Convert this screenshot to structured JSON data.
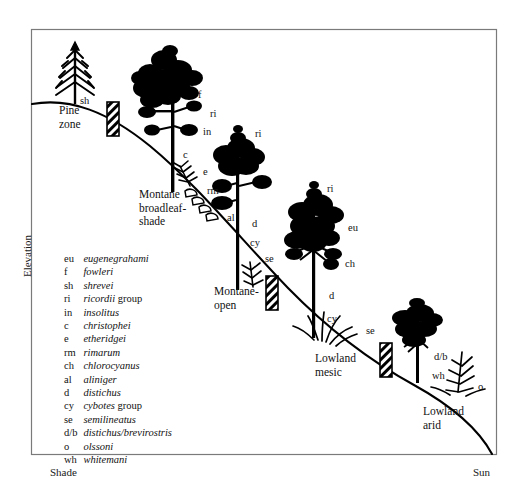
{
  "figure": {
    "axes": {
      "y_label": "Elevation",
      "x_left_label": "Shade",
      "x_right_label": "Sun"
    },
    "zones": [
      {
        "id": "pine",
        "label": "Pine\nzone"
      },
      {
        "id": "montane-broadleaf-shade",
        "label": "Montane\nbroadleaf-\nshade"
      },
      {
        "id": "montane-open",
        "label": "Montane-\nopen"
      },
      {
        "id": "lowland-mesic",
        "label": "Lowland\nmesic"
      },
      {
        "id": "lowland-arid",
        "label": "Lowland\narid"
      }
    ],
    "species_marks": [
      {
        "code": "sh",
        "x": 80,
        "y": 95
      },
      {
        "code": "f",
        "x": 198,
        "y": 89
      },
      {
        "code": "ri",
        "x": 210,
        "y": 108
      },
      {
        "code": "in",
        "x": 203,
        "y": 126
      },
      {
        "code": "c",
        "x": 183,
        "y": 149
      },
      {
        "code": "e",
        "x": 203,
        "y": 166
      },
      {
        "code": "rm",
        "x": 207,
        "y": 185
      },
      {
        "code": "ri",
        "x": 255,
        "y": 128
      },
      {
        "code": "al",
        "x": 227,
        "y": 212
      },
      {
        "code": "d",
        "x": 252,
        "y": 218
      },
      {
        "code": "cy",
        "x": 250,
        "y": 237
      },
      {
        "code": "se",
        "x": 265,
        "y": 253
      },
      {
        "code": "ri",
        "x": 327,
        "y": 183
      },
      {
        "code": "eu",
        "x": 348,
        "y": 222
      },
      {
        "code": "ch",
        "x": 345,
        "y": 258
      },
      {
        "code": "d",
        "x": 329,
        "y": 290
      },
      {
        "code": "cy",
        "x": 327,
        "y": 313
      },
      {
        "code": "se",
        "x": 366,
        "y": 325
      },
      {
        "code": "d/b",
        "x": 434,
        "y": 351
      },
      {
        "code": "wh",
        "x": 432,
        "y": 370
      },
      {
        "code": "o",
        "x": 478,
        "y": 381
      }
    ],
    "legend": [
      {
        "abbr": "eu",
        "name": "eugenegrahami",
        "suffix": ""
      },
      {
        "abbr": "f",
        "name": "fowleri",
        "suffix": ""
      },
      {
        "abbr": "sh",
        "name": "shrevei",
        "suffix": ""
      },
      {
        "abbr": "ri",
        "name": "ricordii",
        "suffix": " group"
      },
      {
        "abbr": "in",
        "name": "insolitus",
        "suffix": ""
      },
      {
        "abbr": "c",
        "name": "christophei",
        "suffix": ""
      },
      {
        "abbr": "e",
        "name": "etheridgei",
        "suffix": ""
      },
      {
        "abbr": "rm",
        "name": "rimarum",
        "suffix": ""
      },
      {
        "abbr": "ch",
        "name": "chlorocyanus",
        "suffix": ""
      },
      {
        "abbr": "al",
        "name": "aliniger",
        "suffix": ""
      },
      {
        "abbr": "d",
        "name": "distichus",
        "suffix": ""
      },
      {
        "abbr": "cy",
        "name": "cybotes",
        "suffix": " group"
      },
      {
        "abbr": "se",
        "name": "semilineatus",
        "suffix": ""
      },
      {
        "abbr": "d/b",
        "name": "distichus/brevirostris",
        "suffix": ""
      },
      {
        "abbr": "o",
        "name": "olssoni",
        "suffix": ""
      },
      {
        "abbr": "wh",
        "name": "whitemani",
        "suffix": ""
      }
    ],
    "colors": {
      "ink": "#000000",
      "background": "#ffffff",
      "frame": "#7a7a7a"
    }
  }
}
